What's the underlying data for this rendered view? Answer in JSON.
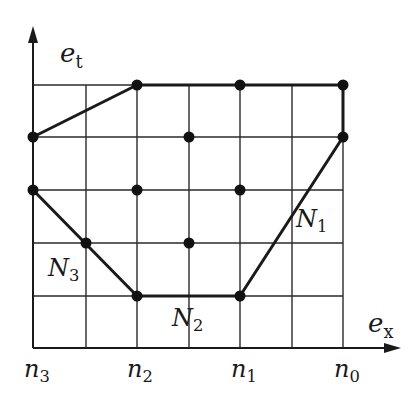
{
  "diagram": {
    "axes": {
      "y_axis_label": {
        "base": "e",
        "sub": "t"
      },
      "x_axis_label": {
        "base": "e",
        "sub": "x"
      }
    },
    "x_tick_labels": [
      {
        "base": "n",
        "sub": "3"
      },
      {
        "base": "n",
        "sub": "2"
      },
      {
        "base": "n",
        "sub": "1"
      },
      {
        "base": "n",
        "sub": "0"
      }
    ],
    "region_labels": [
      {
        "base": "N",
        "sub": "1"
      },
      {
        "base": "N",
        "sub": "2"
      },
      {
        "base": "N",
        "sub": "3"
      }
    ],
    "grid": {
      "columns": 7,
      "rows": 6
    },
    "points": [
      [
        2,
        5
      ],
      [
        4,
        5
      ],
      [
        6,
        5
      ],
      [
        0,
        4
      ],
      [
        3,
        4
      ],
      [
        6,
        4
      ],
      [
        0,
        3
      ],
      [
        2,
        3
      ],
      [
        4,
        3
      ],
      [
        1,
        2
      ],
      [
        3,
        2
      ],
      [
        2,
        1
      ],
      [
        4,
        1
      ]
    ],
    "polygon": [
      [
        0,
        4
      ],
      [
        2,
        5
      ],
      [
        6,
        5
      ],
      [
        6,
        4
      ],
      [
        4,
        1
      ],
      [
        2,
        1
      ],
      [
        0,
        3
      ]
    ],
    "colors": {
      "line": "#1a1a1a",
      "grid": "#2a2a2a",
      "background": "#ffffff"
    }
  }
}
